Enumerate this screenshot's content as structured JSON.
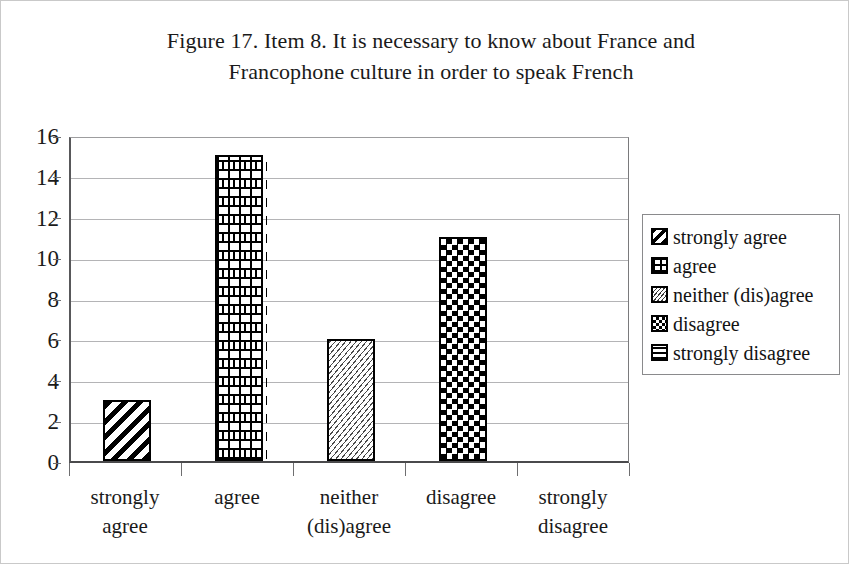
{
  "figure": {
    "title_line1": "Figure 17. Item 8. It is necessary to know about France and",
    "title_line2": "Francophone culture in order to speak French"
  },
  "chart_data": {
    "type": "bar",
    "title": "Figure 17. Item 8. It is necessary to know about France and Francophone culture in order to speak French",
    "categories": [
      "strongly agree",
      "agree",
      "neither (dis)agree",
      "disagree",
      "strongly disagree"
    ],
    "category_lines": [
      [
        "strongly",
        "agree"
      ],
      [
        "agree",
        ""
      ],
      [
        "neither",
        "(dis)agree"
      ],
      [
        "disagree",
        ""
      ],
      [
        "strongly",
        "disagree"
      ]
    ],
    "values": [
      3,
      15,
      6,
      11,
      0
    ],
    "xlabel": "",
    "ylabel": "",
    "ylim": [
      0,
      16
    ],
    "ytick_step": 2,
    "yticks": [
      16,
      14,
      12,
      10,
      8,
      6,
      4,
      2,
      0
    ],
    "grid": true,
    "legend_position": "right",
    "series_patterns": [
      "diagonal",
      "brick",
      "zigzag",
      "checker",
      "hlines"
    ]
  },
  "legend": {
    "items": [
      {
        "label": "strongly agree",
        "pattern": "diagonal"
      },
      {
        "label": "agree",
        "pattern": "brick"
      },
      {
        "label": "neither (dis)agree",
        "pattern": "zigzag"
      },
      {
        "label": "disagree",
        "pattern": "checker"
      },
      {
        "label": "strongly disagree",
        "pattern": "hlines"
      }
    ]
  },
  "colors": {
    "ink": "#000000",
    "gridline": "#b4b4b6",
    "axis": "#4a4a4c",
    "background": "#ffffff",
    "border": "#c9c9c9"
  }
}
